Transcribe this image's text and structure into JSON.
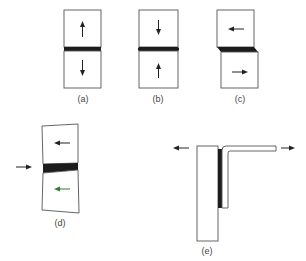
{
  "figure": {
    "panels": [
      {
        "id": "a",
        "label": "(a)",
        "mode": "tension",
        "arrows": [
          "up",
          "down"
        ]
      },
      {
        "id": "b",
        "label": "(b)",
        "mode": "compression",
        "arrows": [
          "down",
          "up"
        ]
      },
      {
        "id": "c",
        "label": "(c)",
        "mode": "shear",
        "arrows": [
          "left",
          "right"
        ]
      },
      {
        "id": "d",
        "label": "(d)",
        "mode": "cleavage",
        "arrows": [
          "left",
          "left",
          "right-external"
        ]
      },
      {
        "id": "e",
        "label": "(e)",
        "mode": "peel",
        "arrows": [
          "left-external",
          "right-external"
        ]
      }
    ]
  },
  "colors": {
    "outline": "#555555",
    "adhesive": "#1c1c1c",
    "arrow": "#222222",
    "arrow_green": "#2e7d32",
    "label": "#444444"
  }
}
